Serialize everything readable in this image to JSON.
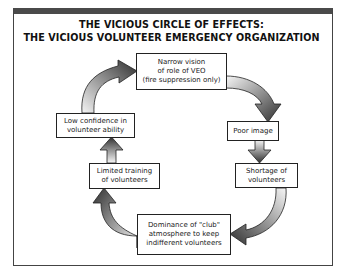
{
  "title": {
    "line1": "THE VICIOUS CIRCLE OF EFFECTS:",
    "line2": "THE VICIOUS VOLUNTEER EMERGENCY ORGANIZATION"
  },
  "nodes": [
    {
      "id": "narrow-vision",
      "label": "Narrow vision\nof role of VEO\n(fire suppression only)"
    },
    {
      "id": "poor-image",
      "label": "Poor image"
    },
    {
      "id": "shortage",
      "label": "Shortage of\nvolunteers"
    },
    {
      "id": "dominance-club",
      "label": "Dominance of \"club\"\natmosphere to keep\nindifferent volunteers"
    },
    {
      "id": "limited-training",
      "label": "Limited training\nof volunteers"
    },
    {
      "id": "low-confidence",
      "label": "Low confidence in\nvolunteer ability"
    }
  ],
  "edges": [
    {
      "from": "narrow-vision",
      "to": "poor-image",
      "shape": "curved"
    },
    {
      "from": "poor-image",
      "to": "shortage",
      "shape": "straight"
    },
    {
      "from": "shortage",
      "to": "dominance-club",
      "shape": "curved"
    },
    {
      "from": "dominance-club",
      "to": "limited-training",
      "shape": "curved"
    },
    {
      "from": "limited-training",
      "to": "low-confidence",
      "shape": "straight"
    },
    {
      "from": "low-confidence",
      "to": "narrow-vision",
      "shape": "curved"
    }
  ],
  "colors": {
    "frame_bar": "#4a4a4a",
    "arrow_dark": "#333333",
    "arrow_light": "#f4f4f4",
    "box_border": "#222222"
  }
}
